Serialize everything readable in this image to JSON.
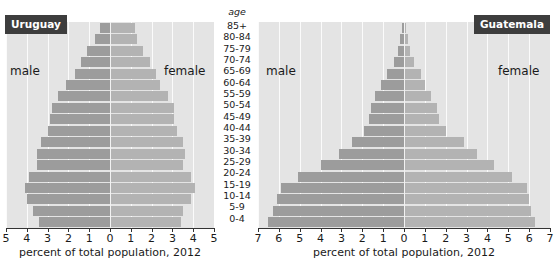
{
  "age_header": "age",
  "age_groups": [
    "85+",
    "80-84",
    "75-79",
    "70-74",
    "65-69",
    "60-64",
    "55-59",
    "50-54",
    "45-49",
    "40-44",
    "35-39",
    "30-34",
    "25-29",
    "20-24",
    "15-19",
    "10-14",
    "5-9",
    "0-4"
  ],
  "charts": [
    {
      "country": "Uruguay",
      "male_label": "male",
      "female_label": "female",
      "xlabel": "percent of total population, 2012",
      "ticks": [
        "5",
        "4",
        "3",
        "2",
        "1",
        "0",
        "1",
        "2",
        "3",
        "4",
        "5"
      ],
      "max": 5
    },
    {
      "country": "Guatemala",
      "male_label": "male",
      "female_label": "female",
      "xlabel": "percent of total population, 2012",
      "ticks": [
        "7",
        "6",
        "5",
        "4",
        "3",
        "2",
        "1",
        "0",
        "1",
        "2",
        "3",
        "4",
        "5",
        "6",
        "7"
      ],
      "max": 7
    }
  ],
  "chart_data": [
    {
      "type": "bar",
      "title": "Uruguay",
      "orientation": "horizontal-population-pyramid",
      "categories": [
        "85+",
        "80-84",
        "75-79",
        "70-74",
        "65-69",
        "60-64",
        "55-59",
        "50-54",
        "45-49",
        "40-44",
        "35-39",
        "30-34",
        "25-29",
        "20-24",
        "15-19",
        "10-14",
        "5-9",
        "0-4"
      ],
      "series": [
        {
          "name": "male",
          "values": [
            0.5,
            0.7,
            1.1,
            1.4,
            1.7,
            2.1,
            2.5,
            2.8,
            2.9,
            3.0,
            3.3,
            3.5,
            3.5,
            3.9,
            4.1,
            4.0,
            3.7,
            3.4
          ]
        },
        {
          "name": "female",
          "values": [
            1.2,
            1.3,
            1.6,
            1.9,
            2.2,
            2.4,
            2.8,
            3.1,
            3.1,
            3.2,
            3.5,
            3.6,
            3.5,
            3.9,
            4.1,
            3.9,
            3.5,
            3.4
          ]
        }
      ],
      "xlabel": "percent of total population, 2012",
      "ylabel": "age",
      "xlim": [
        -5,
        5
      ],
      "grid": true
    },
    {
      "type": "bar",
      "title": "Guatemala",
      "orientation": "horizontal-population-pyramid",
      "categories": [
        "85+",
        "80-84",
        "75-79",
        "70-74",
        "65-69",
        "60-64",
        "55-59",
        "50-54",
        "45-49",
        "40-44",
        "35-39",
        "30-34",
        "25-29",
        "20-24",
        "15-19",
        "10-14",
        "5-9",
        "0-4"
      ],
      "series": [
        {
          "name": "male",
          "values": [
            0.1,
            0.2,
            0.3,
            0.5,
            0.8,
            1.1,
            1.4,
            1.6,
            1.7,
            1.9,
            2.5,
            3.1,
            4.0,
            5.1,
            5.9,
            6.1,
            6.3,
            6.5
          ]
        },
        {
          "name": "female",
          "values": [
            0.1,
            0.2,
            0.3,
            0.5,
            0.8,
            1.0,
            1.3,
            1.6,
            1.7,
            2.0,
            2.9,
            3.5,
            4.3,
            5.2,
            5.9,
            6.0,
            6.1,
            6.3
          ]
        }
      ],
      "xlabel": "percent of total population, 2012",
      "ylabel": "age",
      "xlim": [
        -7,
        7
      ],
      "grid": true
    }
  ]
}
